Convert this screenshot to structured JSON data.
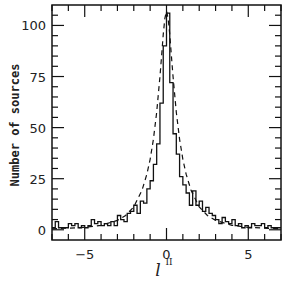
{
  "chart_data": {
    "type": "line",
    "title": "",
    "xlabel": "l",
    "xlabel_superscript": "II",
    "ylabel": "Number of sources",
    "xlim": [
      -7,
      7
    ],
    "ylim": [
      -5,
      110
    ],
    "grid": false,
    "legend": null,
    "x_ticks": [
      -5,
      0,
      5
    ],
    "x_tick_labels": [
      "−5",
      "0",
      "5"
    ],
    "y_ticks": [
      0,
      25,
      50,
      75,
      100
    ],
    "y_tick_labels": [
      "0",
      "25",
      "50",
      "75",
      "100"
    ],
    "series": [
      {
        "name": "observed histogram",
        "style": "solid-step",
        "bin_width": 0.2,
        "x": [
          -7.0,
          -6.8,
          -6.6,
          -6.4,
          -6.2,
          -6.0,
          -5.8,
          -5.6,
          -5.4,
          -5.2,
          -5.0,
          -4.8,
          -4.6,
          -4.4,
          -4.2,
          -4.0,
          -3.8,
          -3.6,
          -3.4,
          -3.2,
          -3.0,
          -2.8,
          -2.6,
          -2.4,
          -2.2,
          -2.0,
          -1.8,
          -1.6,
          -1.4,
          -1.2,
          -1.0,
          -0.8,
          -0.6,
          -0.4,
          -0.2,
          0.0,
          0.2,
          0.4,
          0.6,
          0.8,
          1.0,
          1.2,
          1.4,
          1.6,
          1.8,
          2.0,
          2.2,
          2.4,
          2.6,
          2.8,
          3.0,
          3.2,
          3.4,
          3.6,
          3.8,
          4.0,
          4.2,
          4.4,
          4.6,
          4.8,
          5.0,
          5.2,
          5.4,
          5.6,
          5.8,
          6.0,
          6.2,
          6.4,
          6.6,
          6.8
        ],
        "values": [
          1,
          4,
          1,
          1,
          1,
          3,
          2,
          3,
          1,
          2,
          1,
          2,
          5,
          3,
          4,
          2,
          3,
          2,
          4,
          2,
          7,
          5,
          4,
          8,
          9,
          12,
          8,
          14,
          13,
          20,
          24,
          32,
          42,
          62,
          90,
          106,
          72,
          47,
          37,
          26,
          22,
          18,
          12,
          19,
          12,
          14,
          9,
          11,
          8,
          7,
          5,
          3,
          6,
          4,
          3,
          5,
          2,
          3,
          1,
          2,
          1,
          3,
          2,
          2,
          3,
          1,
          2,
          1,
          1,
          1
        ]
      },
      {
        "name": "model fit",
        "style": "dashed",
        "x": [
          -7.0,
          -6.0,
          -5.0,
          -4.0,
          -3.0,
          -2.5,
          -2.0,
          -1.5,
          -1.2,
          -1.0,
          -0.8,
          -0.6,
          -0.4,
          -0.3,
          -0.2,
          -0.1,
          0.0,
          0.1,
          0.2,
          0.3,
          0.4,
          0.6,
          0.8,
          1.0,
          1.2,
          1.5,
          2.0,
          2.5,
          3.0,
          4.0,
          5.0,
          6.0,
          7.0
        ],
        "values": [
          0.5,
          0.8,
          1.2,
          2.2,
          4.6,
          7.0,
          11.2,
          19.3,
          27.2,
          34.5,
          44.3,
          57.5,
          75.0,
          85.0,
          95.5,
          103.5,
          107.0,
          103.5,
          95.5,
          85.0,
          75.0,
          57.5,
          44.3,
          34.5,
          27.2,
          19.3,
          11.2,
          7.0,
          4.6,
          2.2,
          1.2,
          0.8,
          0.5
        ]
      }
    ]
  },
  "axes": {
    "ylabel": "Number of sources",
    "xlabel": "l",
    "xlabel_sup": "II"
  }
}
